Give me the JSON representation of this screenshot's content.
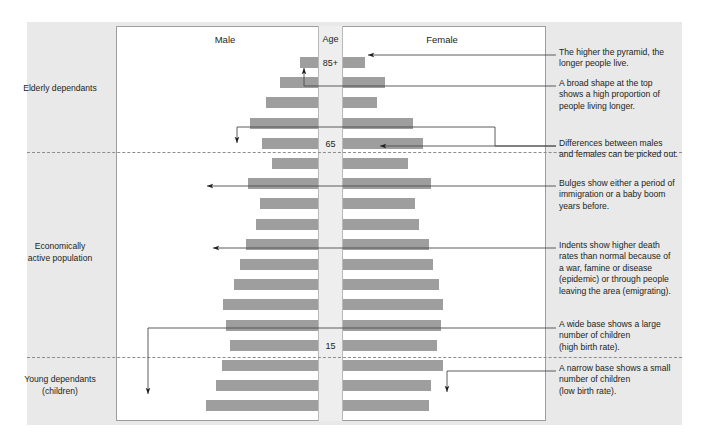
{
  "figure": {
    "column_headers": {
      "male": "Male",
      "age": "Age",
      "female": "Female"
    },
    "age_markers": [
      {
        "label": "85+",
        "y": 63
      },
      {
        "label": "65",
        "y": 140
      },
      {
        "label": "15",
        "y": 341
      }
    ],
    "side_categories": [
      {
        "label": "Elderly dependants"
      },
      {
        "label": "Economically\nactive population"
      },
      {
        "label": "Young dependants\n(children)"
      }
    ],
    "side_category_lines": {
      "elderly": "Elderly dependants",
      "economic_line1": "Economically",
      "economic_line2": "active population",
      "young_line1": "Young dependants",
      "young_line2": "(children)"
    },
    "annotations": [
      {
        "id": "note-higher-pyramid",
        "line1": "The higher the pyramid, the",
        "line2": "longer people live.",
        "line3": "",
        "line4": "",
        "line5": ""
      },
      {
        "id": "note-broad-top",
        "line1": "A broad shape at the top",
        "line2": "shows a high proportion of",
        "line3": "people living longer.",
        "line4": "",
        "line5": ""
      },
      {
        "id": "note-differences",
        "line1": "Differences between males",
        "line2": "and females can be picked out.",
        "line3": "",
        "line4": "",
        "line5": ""
      },
      {
        "id": "note-bulges",
        "line1": "Bulges show either a period of",
        "line2": "immigration or a baby boom",
        "line3": "years before.",
        "line4": "",
        "line5": ""
      },
      {
        "id": "note-indents",
        "line1": "Indents show higher death",
        "line2": "rates than normal because of",
        "line3": "a war, famine or disease",
        "line4": "(epidemic) or through people",
        "line5": "leaving the area (emigrating)."
      },
      {
        "id": "note-wide-base",
        "line1": "A wide base shows a large",
        "line2": "number of children",
        "line3": "(high birth rate).",
        "line4": "",
        "line5": ""
      },
      {
        "id": "note-narrow-base",
        "line1": "A narrow base shows a small",
        "line2": "number of children",
        "line3": "(low birth rate).",
        "line4": "",
        "line5": ""
      }
    ],
    "colors": {
      "bar": "#9e9e9e",
      "panel": "#e9e9e9",
      "chart_background": "#ffffff",
      "age_column": "#eeeeee",
      "border": "#9d9d9d",
      "text": "#231f20"
    }
  },
  "chart_data": {
    "type": "bar",
    "subtype": "population-pyramid",
    "title": "",
    "xlabel": "",
    "ylabel": "Age",
    "grid": false,
    "legend": [
      "Male",
      "Female"
    ],
    "legend_position": "top",
    "axis_markers": [
      "85+",
      "65",
      "15"
    ],
    "categories": [
      "85+",
      "80-84",
      "75-79",
      "70-74",
      "65-69",
      "60-64",
      "55-59",
      "50-54",
      "45-49",
      "40-44",
      "35-39",
      "30-34",
      "25-29",
      "20-24",
      "15-19",
      "10-14",
      "5-9",
      "0-4"
    ],
    "series": [
      {
        "name": "Male",
        "values": [
          18,
          38,
          52,
          68,
          56,
          46,
          70,
          58,
          62,
          72,
          78,
          84,
          95,
          92,
          88,
          96,
          102,
          112
        ]
      },
      {
        "name": "Female",
        "values": [
          22,
          42,
          34,
          70,
          80,
          65,
          88,
          72,
          76,
          86,
          90,
          96,
          100,
          98,
          94,
          100,
          88,
          86
        ]
      }
    ],
    "notes": [
      "The higher the pyramid, the longer people live.",
      "A broad shape at the top shows a high proportion of people living longer.",
      "Differences between males and females can be picked out.",
      "Bulges show either a period of immigration or a baby boom years before.",
      "Indents show higher death rates than normal because of a war, famine or disease (epidemic) or through people leaving the area (emigrating).",
      "A wide base shows a large number of children (high birth rate).",
      "A narrow base shows a small number of children (low birth rate)."
    ]
  }
}
